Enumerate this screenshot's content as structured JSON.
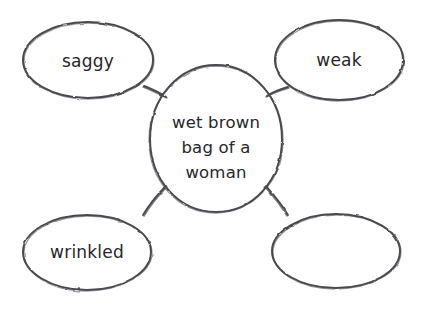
{
  "diagram": {
    "type": "bubble-map",
    "title": "",
    "style": "hand-drawn pencil sketch on white paper",
    "background_color": "#ffffff",
    "stroke_color": "#4a4a50",
    "text_color": "#26262b",
    "center": {
      "id": "center-bubble",
      "lines": [
        "wet brown",
        "bag of a",
        "woman"
      ],
      "line1": "wet brown",
      "line2": "bag of a",
      "line3": "woman",
      "shape": "ellipse",
      "cx": 216,
      "cy": 139,
      "rx": 66,
      "ry": 74
    },
    "satellites": [
      {
        "id": "bubble-saggy",
        "label": "saggy",
        "position": "top-left",
        "empty": false,
        "cx": 88,
        "cy": 60,
        "rx": 65,
        "ry": 38
      },
      {
        "id": "bubble-weak",
        "label": "weak",
        "position": "top-right",
        "empty": false,
        "cx": 339,
        "cy": 60,
        "rx": 64,
        "ry": 40
      },
      {
        "id": "bubble-wrinkled",
        "label": "wrinkled",
        "position": "bottom-left",
        "empty": false,
        "cx": 87,
        "cy": 252,
        "rx": 64,
        "ry": 37
      },
      {
        "id": "bubble-empty",
        "label": "",
        "position": "bottom-right",
        "empty": true,
        "cx": 336,
        "cy": 251,
        "rx": 64,
        "ry": 37
      }
    ],
    "connectors": [
      {
        "id": "connector-center-saggy",
        "from": "center-bubble",
        "to": "bubble-saggy"
      },
      {
        "id": "connector-center-weak",
        "from": "center-bubble",
        "to": "bubble-weak"
      },
      {
        "id": "connector-center-wrinkled",
        "from": "center-bubble",
        "to": "bubble-wrinkled"
      },
      {
        "id": "connector-center-empty",
        "from": "center-bubble",
        "to": "bubble-empty"
      }
    ]
  }
}
